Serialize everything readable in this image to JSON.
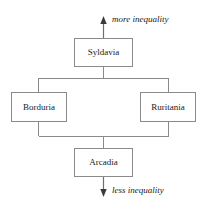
{
  "diagram": {
    "type": "hierarchy-flow",
    "orientation": "vertical",
    "background_color": "#ffffff",
    "box_stroke_color": "#8a8a8a",
    "connector_color": "#8a8a8a",
    "axis_color": "#3a3a3a",
    "text_color": "#1a1a1a",
    "axis": {
      "top_label": "more inequality",
      "bottom_label": "less inequality"
    },
    "nodes": [
      {
        "id": "syldavia",
        "label": "Syldavia",
        "rank": 1,
        "level": "top"
      },
      {
        "id": "borduria",
        "label": "Borduria",
        "rank": 2,
        "level": "middle-left"
      },
      {
        "id": "ruritania",
        "label": "Ruritania",
        "rank": 2,
        "level": "middle-right"
      },
      {
        "id": "arcadia",
        "label": "Arcadia",
        "rank": 3,
        "level": "bottom"
      }
    ],
    "edges": [
      {
        "from": "syldavia",
        "to": "borduria"
      },
      {
        "from": "syldavia",
        "to": "ruritania"
      },
      {
        "from": "borduria",
        "to": "arcadia"
      },
      {
        "from": "ruritania",
        "to": "arcadia"
      }
    ]
  }
}
